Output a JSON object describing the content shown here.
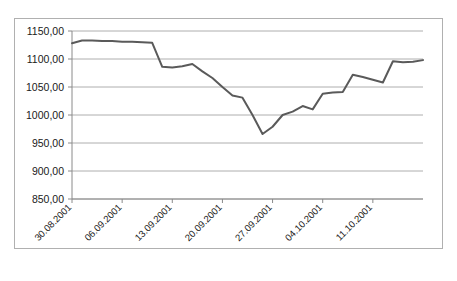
{
  "chart_data": {
    "type": "line",
    "title": "",
    "xlabel": "",
    "ylabel": "",
    "ylim": [
      850,
      1150
    ],
    "y_ticks": [
      "850,00",
      "900,00",
      "950,00",
      "1000,00",
      "1050,00",
      "1100,00",
      "1150,00"
    ],
    "y_tick_values": [
      850,
      900,
      950,
      1000,
      1050,
      1100,
      1150
    ],
    "grid": true,
    "legend": "none",
    "decimal_separator": ",",
    "x_tick_labels": [
      "30.08.2001",
      "06.09.2001",
      "13.09.2001",
      "20.09.2001",
      "27.09.2001",
      "04.10.2001",
      "11.10.2001"
    ],
    "x_tick_indices": [
      0,
      5,
      10,
      15,
      20,
      25,
      30
    ],
    "series": [
      {
        "name": "Index",
        "color": "#5a5a5a",
        "values": [
          1128,
          1133,
          1133,
          1132,
          1132,
          1131,
          1131,
          1130,
          1129,
          1086,
          1085,
          1087,
          1091,
          1078,
          1066,
          1050,
          1035,
          1031,
          1000,
          966,
          979,
          1000,
          1006,
          1016,
          1010,
          1038,
          1040,
          1041,
          1072,
          1068,
          1063,
          1058,
          1096,
          1094,
          1095,
          1098
        ]
      }
    ]
  },
  "axis": {
    "y_title": "",
    "x_title": ""
  }
}
